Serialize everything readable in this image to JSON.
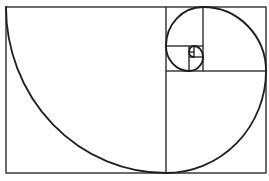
{
  "diagram": {
    "colors": {
      "background": "#ffffff",
      "grid_stroke": "#3a3a3a",
      "spiral_stroke": "#1e1e1e"
    },
    "outer_rect": {
      "x": 6,
      "y": 7,
      "w": 260,
      "h": 166
    },
    "squares": [
      {
        "x": 6,
        "y": 7,
        "w": 160,
        "h": 166
      },
      {
        "x": 166,
        "y": 71,
        "w": 100,
        "h": 102
      },
      {
        "x": 203,
        "y": 7,
        "w": 63,
        "h": 64
      },
      {
        "x": 166,
        "y": 7,
        "w": 37,
        "h": 39
      },
      {
        "x": 166,
        "y": 46,
        "w": 23,
        "h": 25
      },
      {
        "x": 189,
        "y": 57,
        "w": 14,
        "h": 14
      },
      {
        "x": 194,
        "y": 46,
        "w": 9,
        "h": 11
      },
      {
        "x": 189,
        "y": 46,
        "w": 5,
        "h": 6
      },
      {
        "x": 189,
        "y": 52,
        "w": 5,
        "h": 5
      }
    ],
    "spiral_arcs": [
      {
        "from": [
          6,
          7
        ],
        "to": [
          166,
          173
        ],
        "rx": 160,
        "ry": 166
      },
      {
        "from": [
          166,
          173
        ],
        "to": [
          266,
          71
        ],
        "rx": 100,
        "ry": 102
      },
      {
        "from": [
          266,
          71
        ],
        "to": [
          203,
          7
        ],
        "rx": 63,
        "ry": 64
      },
      {
        "from": [
          203,
          7
        ],
        "to": [
          166,
          46
        ],
        "rx": 37,
        "ry": 39
      },
      {
        "from": [
          166,
          46
        ],
        "to": [
          189,
          71
        ],
        "rx": 23,
        "ry": 25
      },
      {
        "from": [
          189,
          71
        ],
        "to": [
          203,
          57
        ],
        "rx": 14,
        "ry": 14
      },
      {
        "from": [
          203,
          57
        ],
        "to": [
          194,
          46
        ],
        "rx": 9,
        "ry": 11
      },
      {
        "from": [
          194,
          46
        ],
        "to": [
          189,
          52
        ],
        "rx": 5,
        "ry": 6
      },
      {
        "from": [
          189,
          52
        ],
        "to": [
          194,
          57
        ],
        "rx": 5,
        "ry": 5
      }
    ]
  }
}
